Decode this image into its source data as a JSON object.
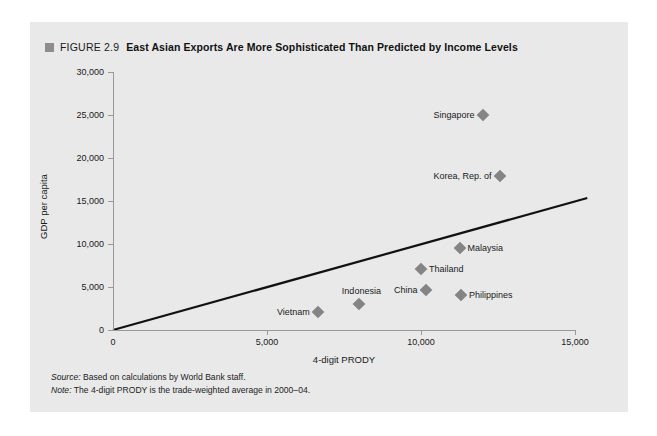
{
  "figure": {
    "number_label": "FIGURE 2.9",
    "title": "East Asian Exports Are More Sophisticated Than Predicted by Income Levels",
    "marker_color": "#8d8d8d",
    "panel_color": "#e9e9e9"
  },
  "notes": {
    "source_label": "Source:",
    "source_text": " Based on calculations by World Bank staff.",
    "note_label": "Note:",
    "note_text": " The 4-digit PRODY is the trade-weighted average in 2000–04."
  },
  "chart_data": {
    "type": "scatter",
    "title": "East Asian Exports Are More Sophisticated Than Predicted by Income Levels",
    "xlabel": "4-digit PRODY",
    "ylabel": "GDP per capita",
    "xlim": [
      0,
      15000
    ],
    "ylim": [
      0,
      30000
    ],
    "xticks": [
      0,
      5000,
      10000,
      15000
    ],
    "xticklabels": [
      "0",
      "5,000",
      "10,000",
      "15,000"
    ],
    "yticks": [
      0,
      5000,
      10000,
      15000,
      20000,
      25000,
      30000
    ],
    "yticklabels": [
      "0",
      "5,000",
      "10,000",
      "15,000",
      "20,000",
      "25,000",
      "30,000"
    ],
    "grid": false,
    "legend": "none",
    "marker_color": "#848484",
    "marker_shape": "diamond",
    "points": [
      {
        "name": "Singapore",
        "x": 12000,
        "y": 25000,
        "label_side": "left"
      },
      {
        "name": "Korea, Rep. of",
        "x": 12550,
        "y": 17900,
        "label_side": "left"
      },
      {
        "name": "Malaysia",
        "x": 11250,
        "y": 9500,
        "label_side": "right"
      },
      {
        "name": "Thailand",
        "x": 10000,
        "y": 7100,
        "label_side": "right"
      },
      {
        "name": "China",
        "x": 10150,
        "y": 4700,
        "label_side": "left"
      },
      {
        "name": "Philippines",
        "x": 11300,
        "y": 4100,
        "label_side": "right"
      },
      {
        "name": "Indonesia",
        "x": 8000,
        "y": 3000,
        "label_side": "above"
      },
      {
        "name": "Vietnam",
        "x": 6650,
        "y": 2100,
        "label_side": "left"
      }
    ],
    "trend_line": {
      "name": "fitted line",
      "x": [
        0,
        15400
      ],
      "y": [
        0,
        15350
      ],
      "color": "#111111"
    }
  }
}
